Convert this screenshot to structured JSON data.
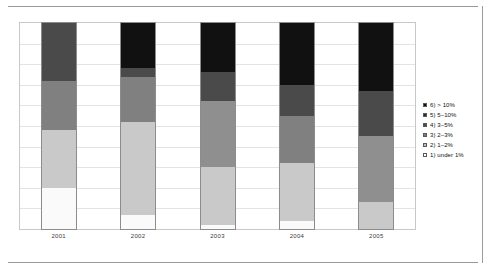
{
  "chart_data": {
    "type": "bar",
    "subtype": "stacked-column-100",
    "title": "",
    "subtitle": "",
    "xlabel": "",
    "ylabel": "",
    "ylim": [
      0,
      100
    ],
    "grid": true,
    "gridlines": 10,
    "legend_position": "right",
    "categories": [
      "2001",
      "2002",
      "2003",
      "2004",
      "2005"
    ],
    "series": [
      {
        "name": "6) > 10%",
        "color": "#111111",
        "values": [
          0,
          22,
          24,
          30,
          33
        ]
      },
      {
        "name": "5) 5–10%",
        "color": "#4a4a4a",
        "values": [
          28,
          4,
          14,
          15,
          22
        ]
      },
      {
        "name": "4) 3–5%",
        "color": "#808080",
        "values": [
          24,
          22,
          0,
          23,
          0
        ]
      },
      {
        "name": "3) 2–3%",
        "color": "#8f8f8f",
        "values": [
          0,
          0,
          32,
          0,
          32
        ]
      },
      {
        "name": "2) 1–2%",
        "color": "#c9c9c9",
        "values": [
          28,
          45,
          28,
          28,
          13
        ]
      },
      {
        "name": "1) under 1%",
        "color": "#fafafa",
        "values": [
          20,
          7,
          2,
          4,
          0
        ]
      }
    ],
    "annotations": []
  },
  "axis": {
    "x_tick_labels": [
      "2001",
      "2002",
      "2003",
      "2004",
      "2005"
    ]
  },
  "legend": {
    "items": [
      {
        "label": "6) > 10%",
        "color": "#111111"
      },
      {
        "label": "5) 5–10%",
        "color": "#2b2b2b"
      },
      {
        "label": "4) 3–5%",
        "color": "#4a4a4a"
      },
      {
        "label": "3) 2–3%",
        "color": "#7a7a7a"
      },
      {
        "label": "2) 1–2%",
        "color": "#bdbdbd"
      },
      {
        "label": "1) under 1%",
        "color": "#ffffff"
      }
    ]
  },
  "colors": {
    "frame_border": "#c8c8c8",
    "gridline": "#e3e3e3",
    "bar_border": "#8c8c8c",
    "rule": "#9a9a9a",
    "text": "#111111",
    "axis_text": "#3a3a3a"
  }
}
